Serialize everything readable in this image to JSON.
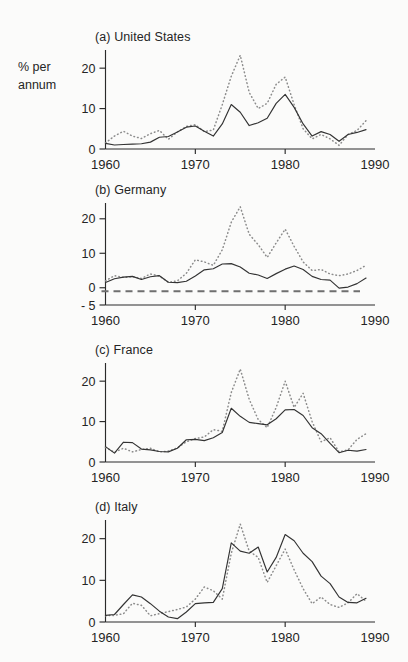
{
  "figure": {
    "axis_title": "% per annum",
    "axis_title_line1": "% per",
    "axis_title_line2": "annum",
    "background_color": "#fbfbfa",
    "solid_color": "#333333",
    "dotted_color": "#8c8c8c"
  },
  "chart_data": [
    {
      "type": "line",
      "title": "(a) United States",
      "panel_id": "a",
      "xlabel": "",
      "ylabel": "% per annum",
      "xlim": [
        1960,
        1990
      ],
      "ylim": [
        0,
        24
      ],
      "yticks": [
        0,
        10,
        20
      ],
      "ytick_labels": [
        "0",
        "10",
        "20"
      ],
      "xticks": [
        1960,
        1970,
        1980,
        1990
      ],
      "xtick_labels": [
        "1960",
        "1970",
        "1980",
        "1990"
      ],
      "grid": false,
      "legend": "none",
      "zero_line": false,
      "x": [
        1960,
        1961,
        1962,
        1963,
        1964,
        1965,
        1966,
        1967,
        1968,
        1969,
        1970,
        1971,
        1972,
        1973,
        1974,
        1975,
        1976,
        1977,
        1978,
        1979,
        1980,
        1981,
        1982,
        1983,
        1984,
        1985,
        1986,
        1987,
        1988,
        1989
      ],
      "series": [
        {
          "name": "solid",
          "style": "solid",
          "values": [
            1.4,
            1.0,
            1.1,
            1.2,
            1.3,
            1.7,
            2.9,
            3.1,
            4.2,
            5.4,
            5.7,
            4.4,
            3.2,
            6.2,
            11.0,
            9.1,
            5.8,
            6.5,
            7.6,
            11.3,
            13.5,
            10.3,
            6.2,
            3.2,
            4.3,
            3.6,
            1.9,
            3.6,
            4.1,
            4.8
          ]
        },
        {
          "name": "dotted",
          "style": "dotted",
          "values": [
            1.5,
            3.2,
            4.4,
            3.2,
            2.6,
            3.8,
            4.6,
            2.4,
            4.2,
            5.6,
            6.0,
            4.3,
            4.7,
            11.0,
            18.0,
            23.2,
            14.0,
            10.0,
            11.3,
            16.0,
            17.8,
            11.0,
            5.0,
            2.5,
            3.6,
            2.5,
            0.9,
            3.6,
            4.6,
            7.0
          ]
        }
      ]
    },
    {
      "type": "line",
      "title": "(b) Germany",
      "panel_id": "b",
      "xlabel": "",
      "ylabel": "% per annum",
      "xlim": [
        1960,
        1990
      ],
      "ylim": [
        -5,
        24
      ],
      "yticks": [
        -5,
        0,
        10,
        20
      ],
      "ytick_labels": [
        "- 5",
        "0",
        "10",
        "20"
      ],
      "xticks": [
        1960,
        1970,
        1980,
        1990
      ],
      "xtick_labels": [
        "1960",
        "1970",
        "1980",
        "1990"
      ],
      "grid": false,
      "legend": "none",
      "zero_line": true,
      "zero_line_value": -1,
      "x": [
        1960,
        1961,
        1962,
        1963,
        1964,
        1965,
        1966,
        1967,
        1968,
        1969,
        1970,
        1971,
        1972,
        1973,
        1974,
        1975,
        1976,
        1977,
        1978,
        1979,
        1980,
        1981,
        1982,
        1983,
        1984,
        1985,
        1986,
        1987,
        1988,
        1989
      ],
      "series": [
        {
          "name": "solid",
          "style": "solid",
          "values": [
            1.5,
            2.6,
            3.1,
            3.3,
            2.4,
            3.2,
            3.5,
            1.6,
            1.5,
            1.9,
            3.4,
            5.2,
            5.5,
            6.9,
            7.0,
            6.0,
            4.2,
            3.7,
            2.7,
            4.1,
            5.4,
            6.3,
            5.3,
            3.3,
            2.4,
            2.2,
            -0.1,
            0.2,
            1.2,
            2.8
          ]
        },
        {
          "name": "dotted",
          "style": "dotted",
          "values": [
            2.0,
            3.5,
            3.0,
            3.2,
            2.7,
            4.0,
            3.4,
            1.6,
            2.0,
            4.2,
            8.1,
            7.5,
            6.5,
            11.0,
            19.0,
            23.5,
            15.5,
            12.5,
            8.8,
            13.0,
            17.0,
            12.0,
            7.5,
            5.0,
            5.3,
            4.0,
            3.5,
            4.0,
            5.0,
            6.5
          ]
        }
      ]
    },
    {
      "type": "line",
      "title": "(c) France",
      "panel_id": "c",
      "xlabel": "",
      "ylabel": "% per annum",
      "xlim": [
        1960,
        1990
      ],
      "ylim": [
        0,
        24
      ],
      "yticks": [
        0,
        10,
        20
      ],
      "ytick_labels": [
        "0",
        "10",
        "20"
      ],
      "xticks": [
        1960,
        1970,
        1980,
        1990
      ],
      "xtick_labels": [
        "1960",
        "1970",
        "1980",
        "1990"
      ],
      "grid": false,
      "legend": "none",
      "zero_line": false,
      "x": [
        1960,
        1961,
        1962,
        1963,
        1964,
        1965,
        1966,
        1967,
        1968,
        1969,
        1970,
        1971,
        1972,
        1973,
        1974,
        1975,
        1976,
        1977,
        1978,
        1979,
        1980,
        1981,
        1982,
        1983,
        1984,
        1985,
        1986,
        1987,
        1988,
        1989
      ],
      "series": [
        {
          "name": "solid",
          "style": "solid",
          "values": [
            3.8,
            2.2,
            4.9,
            4.8,
            3.2,
            3.0,
            2.6,
            2.5,
            3.4,
            5.5,
            5.6,
            5.3,
            6.0,
            7.3,
            13.3,
            11.3,
            9.8,
            9.5,
            9.2,
            10.7,
            12.9,
            13.0,
            11.5,
            8.5,
            7.0,
            4.6,
            2.3,
            2.9,
            2.7,
            3.1
          ]
        },
        {
          "name": "dotted",
          "style": "dotted",
          "values": [
            3.6,
            2.4,
            3.4,
            2.5,
            3.1,
            3.4,
            2.5,
            2.7,
            3.5,
            5.0,
            5.8,
            6.2,
            8.0,
            7.6,
            17.2,
            23.0,
            15.5,
            10.5,
            8.5,
            13.5,
            20.0,
            13.5,
            17.0,
            10.0,
            5.0,
            6.0,
            2.5,
            3.0,
            5.6,
            7.0
          ]
        }
      ]
    },
    {
      "type": "line",
      "title": "(d) Italy",
      "panel_id": "d",
      "xlabel": "",
      "ylabel": "% per annum",
      "xlim": [
        1960,
        1990
      ],
      "ylim": [
        0,
        24
      ],
      "yticks": [
        0,
        10,
        20
      ],
      "ytick_labels": [
        "0",
        "10",
        "20"
      ],
      "xticks": [
        1960,
        1970,
        1980,
        1990
      ],
      "xtick_labels": [
        "1960",
        "1970",
        "1980",
        "1990"
      ],
      "grid": false,
      "legend": "none",
      "zero_line": false,
      "x": [
        1960,
        1961,
        1962,
        1963,
        1964,
        1965,
        1966,
        1967,
        1968,
        1969,
        1970,
        1971,
        1972,
        1973,
        1974,
        1975,
        1976,
        1977,
        1978,
        1979,
        1980,
        1981,
        1982,
        1983,
        1984,
        1985,
        1986,
        1987,
        1988,
        1989
      ],
      "series": [
        {
          "name": "solid",
          "style": "solid",
          "values": [
            1.6,
            1.8,
            4.2,
            6.5,
            6.0,
            4.4,
            2.6,
            1.2,
            0.8,
            2.4,
            4.4,
            4.6,
            4.7,
            8.0,
            19.0,
            17.0,
            16.5,
            18.0,
            12.0,
            15.5,
            21.0,
            19.5,
            16.5,
            14.5,
            11.0,
            9.2,
            6.0,
            4.7,
            4.6,
            5.7
          ]
        },
        {
          "name": "dotted",
          "style": "dotted",
          "values": [
            1.5,
            1.6,
            2.0,
            4.5,
            4.0,
            1.5,
            2.0,
            2.5,
            3.0,
            3.6,
            5.5,
            8.4,
            7.5,
            5.5,
            16.5,
            23.5,
            17.0,
            15.5,
            9.5,
            13.5,
            17.5,
            12.5,
            8.0,
            4.4,
            6.0,
            4.2,
            3.5,
            4.6,
            6.8,
            5.0
          ]
        }
      ]
    }
  ]
}
